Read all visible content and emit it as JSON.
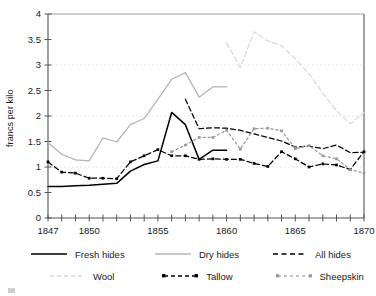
{
  "chart_data": {
    "type": "line",
    "title": "",
    "xlabel": "",
    "ylabel": "francs per kilo",
    "xlim": [
      1847,
      1870
    ],
    "ylim": [
      0,
      4
    ],
    "ytick_values": [
      0,
      0.5,
      1,
      1.5,
      2,
      2.5,
      3,
      3.5,
      4
    ],
    "ytick_labels": [
      "0",
      "0.5",
      "1",
      "1.5",
      "2",
      "2.5",
      "3",
      "3.5",
      "4"
    ],
    "xtick_values": [
      1847,
      1848,
      1849,
      1850,
      1851,
      1852,
      1853,
      1854,
      1855,
      1856,
      1857,
      1858,
      1859,
      1860,
      1861,
      1862,
      1863,
      1864,
      1865,
      1866,
      1867,
      1868,
      1869,
      1870
    ],
    "xtick_labels_shown": [
      "1847",
      "1850",
      "1855",
      "1860",
      "1865",
      "1870"
    ],
    "xtick_labeled_values": [
      1847,
      1850,
      1855,
      1860,
      1865,
      1870
    ],
    "grid": "horizontal dotted gridlines at 1, 2, 3",
    "gridline_values": [
      1,
      2,
      3
    ],
    "legend_position": "below-plot",
    "series": [
      {
        "name": "Fresh hides",
        "style": "solid",
        "color": "#000000",
        "markers": false,
        "x": [
          1847,
          1848,
          1849,
          1850,
          1851,
          1852,
          1853,
          1854,
          1855,
          1856,
          1857,
          1858,
          1859,
          1860
        ],
        "values": [
          0.62,
          0.62,
          0.63,
          0.64,
          0.66,
          0.68,
          0.92,
          1.05,
          1.12,
          2.07,
          1.83,
          1.15,
          1.33,
          1.33
        ]
      },
      {
        "name": "Dry hides",
        "style": "solid",
        "color": "#b4b4b4",
        "markers": false,
        "x": [
          1847,
          1848,
          1849,
          1850,
          1851,
          1852,
          1853,
          1854,
          1855,
          1856,
          1857,
          1858,
          1859,
          1860
        ],
        "values": [
          1.48,
          1.25,
          1.14,
          1.12,
          1.57,
          1.49,
          1.83,
          1.95,
          2.33,
          2.72,
          2.85,
          2.37,
          2.57,
          2.57
        ]
      },
      {
        "name": "All hides",
        "style": "dashed",
        "color": "#000000",
        "markers": false,
        "x": [
          1857,
          1858,
          1859,
          1860,
          1861,
          1862,
          1863,
          1864,
          1865,
          1866,
          1867,
          1868,
          1869,
          1870
        ],
        "values": [
          2.33,
          1.75,
          1.77,
          1.76,
          1.72,
          1.65,
          1.58,
          1.51,
          1.39,
          1.41,
          1.36,
          1.43,
          1.28,
          1.29
        ]
      },
      {
        "name": "Wool",
        "style": "dashed",
        "color": "#d8d8d8",
        "markers": false,
        "x": [
          1860,
          1861,
          1862,
          1863,
          1864,
          1865,
          1866,
          1867,
          1868,
          1869,
          1870
        ],
        "values": [
          3.43,
          2.95,
          3.65,
          3.47,
          3.38,
          3.12,
          2.83,
          2.45,
          2.1,
          1.85,
          2.07
        ]
      },
      {
        "name": "Tallow",
        "style": "dashed",
        "color": "#000000",
        "markers": true,
        "x": [
          1847,
          1848,
          1849,
          1850,
          1851,
          1852,
          1853,
          1854,
          1855,
          1856,
          1857,
          1858,
          1859,
          1860,
          1861,
          1862,
          1863,
          1864,
          1865,
          1866,
          1867,
          1868,
          1869,
          1870
        ],
        "values": [
          1.1,
          0.9,
          0.88,
          0.78,
          0.78,
          0.77,
          1.1,
          1.22,
          1.34,
          1.22,
          1.22,
          1.15,
          1.16,
          1.15,
          1.15,
          1.07,
          1.01,
          1.3,
          1.16,
          1.0,
          1.06,
          1.04,
          0.95,
          1.3
        ]
      },
      {
        "name": "Sheepskin",
        "style": "dotted",
        "color": "#9a9a9a",
        "markers": true,
        "x": [
          1856,
          1857,
          1858,
          1859,
          1860,
          1861,
          1862,
          1863,
          1864,
          1865,
          1866,
          1867,
          1868,
          1869,
          1870
        ],
        "values": [
          1.3,
          1.43,
          1.58,
          1.58,
          1.72,
          1.35,
          1.75,
          1.76,
          1.71,
          1.36,
          1.42,
          1.22,
          1.16,
          0.95,
          0.88
        ]
      }
    ]
  },
  "axes": {
    "ylabel": "francs per kilo",
    "ytick_labels": [
      "0",
      "0.5",
      "1",
      "1.5",
      "2",
      "2.5",
      "3",
      "3.5",
      "4"
    ],
    "xtick_labels": [
      "1847",
      "1850",
      "1855",
      "1860",
      "1865",
      "1870"
    ]
  },
  "legend": {
    "items": [
      {
        "label": "Fresh hides"
      },
      {
        "label": "Dry hides"
      },
      {
        "label": "All hides"
      },
      {
        "label": "Wool"
      },
      {
        "label": "Tallow"
      },
      {
        "label": "Sheepskin"
      }
    ]
  },
  "colors": {
    "fresh_hides": "#000000",
    "dry_hides": "#b4b4b4",
    "all_hides": "#000000",
    "wool": "#d8d8d8",
    "tallow": "#000000",
    "sheepskin": "#9a9a9a",
    "axis": "#555555",
    "text": "#1a1a1a",
    "gridline": "#e2e2e2"
  }
}
